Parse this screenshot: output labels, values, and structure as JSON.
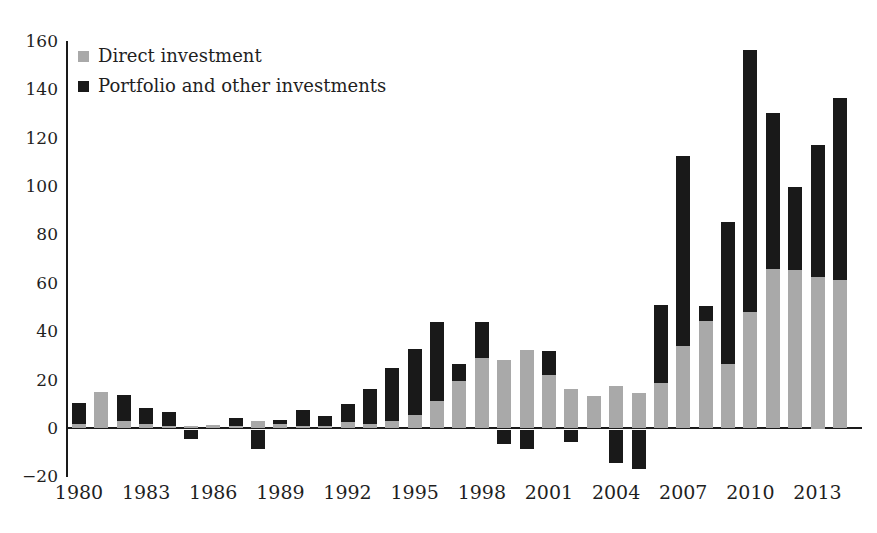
{
  "chart_data": {
    "type": "bar",
    "stacked": true,
    "title": "",
    "xlabel": "",
    "ylabel": "",
    "grid": false,
    "legend_position": "top-left",
    "ylim": [
      -20,
      160
    ],
    "yticks": [
      160,
      140,
      120,
      100,
      80,
      60,
      40,
      20,
      0,
      -20
    ],
    "ytick_labels": [
      "160",
      "140",
      "120",
      "100",
      "80",
      "60",
      "40",
      "20",
      "0",
      "−20"
    ],
    "xtick_labels": [
      "1980",
      "1983",
      "1986",
      "1989",
      "1992",
      "1995",
      "1998",
      "2001",
      "2004",
      "2007",
      "2010",
      "2013"
    ],
    "xtick_step": 3,
    "categories": [
      1980,
      1981,
      1982,
      1983,
      1984,
      1985,
      1986,
      1987,
      1988,
      1989,
      1990,
      1991,
      1992,
      1993,
      1994,
      1995,
      1996,
      1997,
      1998,
      1999,
      2000,
      2001,
      2002,
      2003,
      2004,
      2005,
      2006,
      2007,
      2008,
      2009,
      2010,
      2011,
      2012,
      2013,
      2014
    ],
    "series": [
      {
        "name": "Direct investment",
        "color": "#a9a9a9",
        "values": [
          2,
          15,
          3,
          2,
          1,
          1,
          1.5,
          1,
          3,
          2,
          1,
          1,
          2.5,
          2,
          3,
          5.5,
          11.5,
          19.5,
          29,
          28.5,
          32.5,
          22,
          16.5,
          13.5,
          17.5,
          14.5,
          19,
          34,
          44.5,
          26.5,
          48,
          66,
          65.5,
          62.5,
          61.5
        ]
      },
      {
        "name": "Portfolio and other investments",
        "color": "#191919",
        "values": [
          8.5,
          0,
          11,
          6.5,
          6,
          -4,
          0,
          3.5,
          -8,
          1.5,
          6.5,
          4,
          7.5,
          14.5,
          22,
          27.5,
          32.5,
          7,
          15,
          -6,
          -8,
          10,
          -5,
          0,
          -14,
          -16.5,
          32,
          78.5,
          6,
          59,
          108.5,
          64.5,
          34.5,
          54.5,
          75
        ]
      }
    ]
  },
  "legend": {
    "items": [
      {
        "label": "Direct investment",
        "swatch": "#a9a9a9"
      },
      {
        "label": "Portfolio and other investments",
        "swatch": "#191919"
      }
    ]
  }
}
